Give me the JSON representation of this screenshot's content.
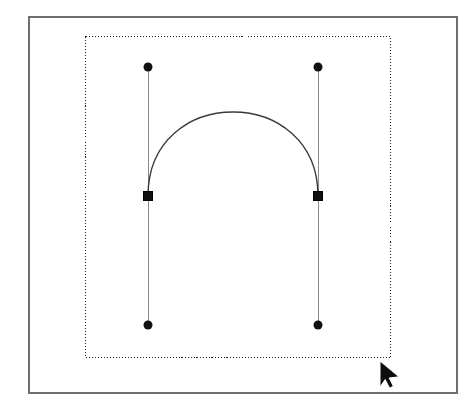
{
  "app": {
    "title": "Vector Path Editor Canvas",
    "tool_mode": "Direct Selection",
    "document_background": "#ffffff"
  },
  "canvas": {
    "width": 476,
    "height": 406,
    "background_color": "#ffffff",
    "frame": {
      "label": "Artboard Frame",
      "x": 28,
      "y": 16,
      "width": 428,
      "height": 376,
      "stroke_color": "#6e6e6e",
      "stroke_width": 1.5,
      "fill": "none"
    }
  },
  "selection_box": {
    "label": "Selection Bounding Box",
    "x": 85,
    "y": 36,
    "width": 305,
    "height": 321,
    "stroke_color": "#1a1a1a",
    "stroke_width": 1,
    "dash_pattern": "1 2",
    "fill": "none"
  },
  "path": {
    "label": "Bezier Arc Path",
    "type": "cubic-bezier",
    "stroke_color": "#3a3a3a",
    "stroke_width": 1.4,
    "fill": "none",
    "d": "M 148 196 C 148 84 318 84 318 196",
    "start_point": {
      "x": 148,
      "y": 196
    },
    "end_point": {
      "x": 318,
      "y": 196
    },
    "control_point_1": {
      "x": 148,
      "y": 84
    },
    "control_point_2": {
      "x": 318,
      "y": 84
    },
    "apex": {
      "x": 233,
      "y": 106
    }
  },
  "anchors": [
    {
      "name": "anchor-point-left",
      "shape": "square",
      "x": 148,
      "y": 196,
      "size": 9,
      "fill_color": "#111111",
      "stroke_color": "#000000",
      "selected": true
    },
    {
      "name": "anchor-point-right",
      "shape": "square",
      "x": 318,
      "y": 196,
      "size": 9,
      "fill_color": "#111111",
      "stroke_color": "#000000",
      "selected": true
    }
  ],
  "handles": [
    {
      "name": "handle-left-top",
      "shape": "circle",
      "radius": 4.5,
      "fill_color": "#111111",
      "anchor": {
        "x": 148,
        "y": 196
      },
      "point": {
        "x": 148,
        "y": 67
      },
      "line_color": "#8a8a8a",
      "line_width": 1
    },
    {
      "name": "handle-left-bottom",
      "shape": "circle",
      "radius": 4.5,
      "fill_color": "#111111",
      "anchor": {
        "x": 148,
        "y": 196
      },
      "point": {
        "x": 148,
        "y": 325
      },
      "line_color": "#8a8a8a",
      "line_width": 1
    },
    {
      "name": "handle-right-top",
      "shape": "circle",
      "radius": 4.5,
      "fill_color": "#111111",
      "anchor": {
        "x": 318,
        "y": 196
      },
      "point": {
        "x": 318,
        "y": 67
      },
      "line_color": "#8a8a8a",
      "line_width": 1
    },
    {
      "name": "handle-right-bottom",
      "shape": "circle",
      "radius": 4.5,
      "fill_color": "#111111",
      "anchor": {
        "x": 318,
        "y": 196
      },
      "point": {
        "x": 318,
        "y": 325
      },
      "line_color": "#8a8a8a",
      "line_width": 1
    }
  ],
  "cursor": {
    "name": "mouse-pointer",
    "x": 380,
    "y": 361,
    "width": 19,
    "height": 26,
    "fill_color": "#0d0d0d",
    "stroke_color": "#ffffff"
  }
}
